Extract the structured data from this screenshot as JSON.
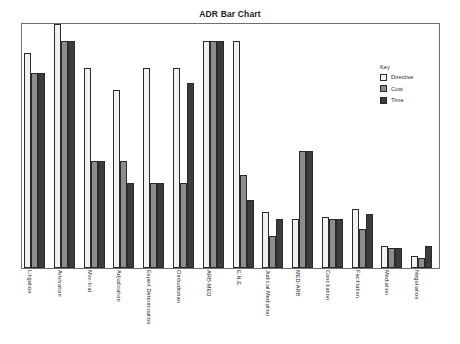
{
  "chart_data": {
    "type": "bar",
    "title": "ADR Bar Chart",
    "xlabel": "",
    "ylabel": "",
    "ylim": [
      0,
      100
    ],
    "grid": false,
    "legend_position": "top-right",
    "legend_title": "Key",
    "categories": [
      "Litigation",
      "Arbitration",
      "Mini-trial",
      "Adjudication",
      "Expert Determination",
      "Ombudsman",
      "ARB-MED",
      "E.N.E.",
      "Judicial Mediation",
      "MED-ARB",
      "Conciliation",
      "Facilitation",
      "Mediation",
      "Negotiation"
    ],
    "series": [
      {
        "name": "Directive",
        "color": "#f2f2f2",
        "values": [
          88,
          100,
          82,
          73,
          82,
          82,
          93,
          93,
          23,
          20,
          21,
          24,
          9,
          5
        ]
      },
      {
        "name": "Cost",
        "color": "#8c8c8c",
        "values": [
          80,
          93,
          44,
          44,
          35,
          35,
          93,
          38,
          13,
          48,
          20,
          16,
          8,
          4
        ]
      },
      {
        "name": "Time",
        "color": "#3c3c3c",
        "values": [
          80,
          93,
          44,
          35,
          35,
          76,
          93,
          28,
          20,
          48,
          20,
          22,
          8,
          9
        ]
      }
    ]
  },
  "legend": {
    "title": "Key",
    "items": [
      {
        "label": "Directive",
        "swatch": "directive"
      },
      {
        "label": "Cost",
        "swatch": "cost"
      },
      {
        "label": "Time",
        "swatch": "time"
      }
    ]
  }
}
